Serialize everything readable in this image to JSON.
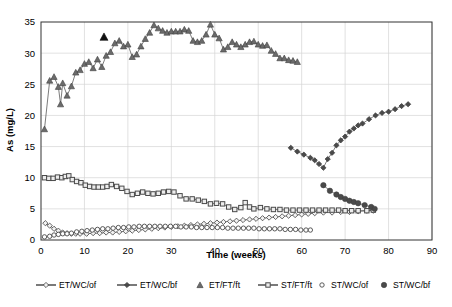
{
  "chart_data": {
    "type": "line",
    "title": "",
    "xlabel": "Time (weeks)",
    "ylabel": "As (mg/L)",
    "xlim": [
      0,
      90
    ],
    "ylim": [
      0,
      35
    ],
    "xticks": [
      0,
      10,
      20,
      30,
      40,
      50,
      60,
      70,
      80,
      90
    ],
    "yticks": [
      0,
      5,
      10,
      15,
      20,
      25,
      30,
      35
    ],
    "grid": true,
    "legend_position": "bottom",
    "series": [
      {
        "name": "ET/WC/of",
        "marker": "open-diamond",
        "color": "#555555",
        "line": true,
        "points": [
          [
            1.0,
            2.7
          ],
          [
            2.0,
            2.3
          ],
          [
            3.0,
            1.8
          ],
          [
            4.0,
            1.5
          ],
          [
            5.0,
            1.2
          ],
          [
            6.0,
            1.1
          ],
          [
            7.0,
            1.0
          ],
          [
            8.0,
            1.0
          ],
          [
            9.0,
            1.0
          ],
          [
            10.5,
            1.0
          ],
          [
            12.0,
            1.1
          ],
          [
            13.5,
            1.1
          ],
          [
            15.0,
            1.2
          ],
          [
            16.5,
            1.2
          ],
          [
            18.0,
            1.3
          ],
          [
            19.5,
            1.4
          ],
          [
            21.0,
            1.5
          ],
          [
            22.5,
            1.6
          ],
          [
            24.0,
            1.7
          ],
          [
            25.5,
            1.8
          ],
          [
            27.0,
            1.9
          ],
          [
            28.5,
            2.0
          ],
          [
            30.0,
            2.1
          ],
          [
            31.5,
            2.2
          ],
          [
            33.0,
            2.3
          ],
          [
            34.5,
            2.4
          ],
          [
            36.0,
            2.5
          ],
          [
            37.5,
            2.6
          ],
          [
            39.0,
            2.7
          ],
          [
            40.5,
            2.8
          ],
          [
            42.0,
            2.9
          ],
          [
            43.5,
            3.0
          ],
          [
            45.0,
            3.1
          ],
          [
            46.5,
            3.2
          ],
          [
            48.0,
            3.3
          ],
          [
            49.5,
            3.4
          ],
          [
            51.0,
            3.5
          ],
          [
            52.5,
            3.6
          ],
          [
            54.0,
            3.7
          ],
          [
            55.5,
            3.8
          ],
          [
            57.0,
            3.9
          ],
          [
            58.5,
            4.0
          ],
          [
            60.0,
            4.1
          ],
          [
            61.5,
            4.2
          ],
          [
            63.0,
            4.3
          ],
          [
            65.0,
            4.4
          ],
          [
            67.0,
            4.4
          ],
          [
            69.0,
            4.5
          ],
          [
            71.0,
            4.5
          ],
          [
            73.0,
            4.6
          ],
          [
            75.0,
            4.7
          ],
          [
            76.5,
            4.7
          ]
        ]
      },
      {
        "name": "ET/WC/bf",
        "marker": "filled-diamond",
        "color": "#4a4a4a",
        "line": true,
        "points": [
          [
            57.5,
            14.8
          ],
          [
            59.0,
            14.2
          ],
          [
            60.5,
            13.7
          ],
          [
            62.0,
            13.2
          ],
          [
            63.0,
            12.8
          ],
          [
            64.0,
            12.2
          ],
          [
            65.0,
            11.6
          ],
          [
            66.0,
            13.0
          ],
          [
            67.0,
            14.0
          ],
          [
            68.0,
            15.2
          ],
          [
            69.0,
            16.0
          ],
          [
            70.0,
            16.6
          ],
          [
            71.0,
            17.4
          ],
          [
            72.0,
            17.9
          ],
          [
            73.0,
            18.4
          ],
          [
            74.0,
            18.7
          ],
          [
            75.5,
            19.4
          ],
          [
            77.0,
            20.0
          ],
          [
            78.5,
            20.4
          ],
          [
            80.0,
            20.6
          ],
          [
            81.5,
            21.0
          ],
          [
            83.0,
            21.5
          ],
          [
            84.5,
            21.8
          ]
        ]
      },
      {
        "name": "ET/FT/ft",
        "marker": "filled-triangle",
        "color": "#6b6b6b",
        "line": true,
        "points": [
          [
            0.8,
            17.8
          ],
          [
            2.0,
            25.6
          ],
          [
            3.0,
            26.2
          ],
          [
            4.0,
            24.6
          ],
          [
            4.5,
            21.8
          ],
          [
            5.0,
            25.2
          ],
          [
            6.0,
            23.2
          ],
          [
            7.0,
            24.7
          ],
          [
            8.0,
            26.9
          ],
          [
            9.0,
            27.3
          ],
          [
            10.0,
            28.3
          ],
          [
            11.0,
            28.6
          ],
          [
            12.0,
            27.6
          ],
          [
            13.0,
            29.0
          ],
          [
            14.0,
            27.8
          ],
          [
            15.0,
            29.6
          ],
          [
            16.0,
            30.2
          ],
          [
            17.0,
            31.6
          ],
          [
            18.0,
            32.0
          ],
          [
            19.0,
            31.1
          ],
          [
            20.0,
            31.4
          ],
          [
            21.0,
            29.4
          ],
          [
            22.0,
            29.8
          ],
          [
            23.0,
            31.1
          ],
          [
            24.0,
            32.3
          ],
          [
            25.0,
            33.3
          ],
          [
            26.0,
            34.5
          ],
          [
            27.0,
            34.0
          ],
          [
            28.0,
            33.6
          ],
          [
            29.0,
            33.3
          ],
          [
            30.0,
            33.5
          ],
          [
            31.0,
            33.5
          ],
          [
            32.0,
            33.5
          ],
          [
            33.0,
            33.8
          ],
          [
            34.0,
            33.6
          ],
          [
            35.0,
            32.0
          ],
          [
            36.0,
            31.8
          ],
          [
            37.0,
            32.0
          ],
          [
            38.0,
            33.0
          ],
          [
            39.0,
            34.6
          ],
          [
            40.0,
            33.0
          ],
          [
            41.0,
            32.4
          ],
          [
            42.0,
            30.6
          ],
          [
            43.0,
            31.0
          ],
          [
            44.0,
            31.8
          ],
          [
            45.0,
            31.4
          ],
          [
            46.0,
            31.0
          ],
          [
            47.0,
            31.4
          ],
          [
            48.0,
            31.8
          ],
          [
            49.0,
            31.9
          ],
          [
            50.0,
            31.4
          ],
          [
            51.0,
            31.2
          ],
          [
            52.0,
            31.3
          ],
          [
            53.0,
            30.4
          ],
          [
            54.0,
            29.9
          ],
          [
            55.0,
            29.2
          ],
          [
            56.0,
            29.2
          ],
          [
            57.0,
            28.9
          ],
          [
            58.0,
            28.8
          ],
          [
            59.0,
            28.6
          ]
        ]
      },
      {
        "name": "ST/FT/ft",
        "marker": "open-square",
        "color": "#777777",
        "line": true,
        "points": [
          [
            0.8,
            10.0
          ],
          [
            1.8,
            9.9
          ],
          [
            2.8,
            9.9
          ],
          [
            3.8,
            10.1
          ],
          [
            4.8,
            10.0
          ],
          [
            5.6,
            10.2
          ],
          [
            6.4,
            10.3
          ],
          [
            7.2,
            9.7
          ],
          [
            8.2,
            9.4
          ],
          [
            9.2,
            9.2
          ],
          [
            10.2,
            8.8
          ],
          [
            11.2,
            8.6
          ],
          [
            12.2,
            8.5
          ],
          [
            13.2,
            8.5
          ],
          [
            14.2,
            8.5
          ],
          [
            15.2,
            8.6
          ],
          [
            16.2,
            8.9
          ],
          [
            17.4,
            8.6
          ],
          [
            18.6,
            8.3
          ],
          [
            19.8,
            7.8
          ],
          [
            21.0,
            7.3
          ],
          [
            22.2,
            7.5
          ],
          [
            23.4,
            7.7
          ],
          [
            24.6,
            7.5
          ],
          [
            25.8,
            7.4
          ],
          [
            27.0,
            7.5
          ],
          [
            28.2,
            7.7
          ],
          [
            29.4,
            7.8
          ],
          [
            30.6,
            7.7
          ],
          [
            32.0,
            7.1
          ],
          [
            33.4,
            6.6
          ],
          [
            34.8,
            6.6
          ],
          [
            36.2,
            6.4
          ],
          [
            37.6,
            6.2
          ],
          [
            39.0,
            5.8
          ],
          [
            40.4,
            5.9
          ],
          [
            41.8,
            5.8
          ],
          [
            43.2,
            5.3
          ],
          [
            44.6,
            4.9
          ],
          [
            46.0,
            5.2
          ],
          [
            47.0,
            6.0
          ],
          [
            48.0,
            5.3
          ],
          [
            49.0,
            5.0
          ],
          [
            50.5,
            5.2
          ],
          [
            52.0,
            5.0
          ],
          [
            53.5,
            4.9
          ],
          [
            55.0,
            4.9
          ],
          [
            56.5,
            4.8
          ],
          [
            58.0,
            4.8
          ],
          [
            59.5,
            4.8
          ],
          [
            61.0,
            4.8
          ],
          [
            62.5,
            4.8
          ],
          [
            64.0,
            4.8
          ],
          [
            65.5,
            4.8
          ],
          [
            67.0,
            4.8
          ],
          [
            68.5,
            4.8
          ],
          [
            70.0,
            4.7
          ],
          [
            71.5,
            4.7
          ],
          [
            73.0,
            4.7
          ],
          [
            75.0,
            4.7
          ],
          [
            76.5,
            4.8
          ]
        ]
      },
      {
        "name": "ST/WC/of",
        "marker": "open-circle",
        "color": "#555555",
        "line": true,
        "points": [
          [
            0.8,
            0.5
          ],
          [
            2.0,
            0.6
          ],
          [
            3.0,
            0.8
          ],
          [
            4.0,
            0.9
          ],
          [
            5.0,
            1.0
          ],
          [
            6.0,
            1.0
          ],
          [
            7.0,
            1.1
          ],
          [
            8.2,
            1.3
          ],
          [
            9.4,
            1.4
          ],
          [
            10.6,
            1.5
          ],
          [
            11.8,
            1.6
          ],
          [
            13.0,
            1.7
          ],
          [
            14.2,
            1.8
          ],
          [
            15.4,
            1.8
          ],
          [
            16.6,
            1.9
          ],
          [
            17.8,
            2.0
          ],
          [
            19.0,
            2.0
          ],
          [
            20.2,
            2.1
          ],
          [
            21.4,
            2.1
          ],
          [
            22.6,
            2.2
          ],
          [
            23.8,
            2.2
          ],
          [
            25.0,
            2.2
          ],
          [
            26.2,
            2.2
          ],
          [
            27.4,
            2.2
          ],
          [
            28.6,
            2.2
          ],
          [
            29.8,
            2.2
          ],
          [
            31.0,
            2.2
          ],
          [
            32.2,
            2.1
          ],
          [
            33.4,
            2.1
          ],
          [
            34.6,
            2.1
          ],
          [
            35.8,
            2.0
          ],
          [
            37.0,
            2.0
          ],
          [
            38.2,
            2.0
          ],
          [
            39.4,
            2.0
          ],
          [
            40.6,
            2.0
          ],
          [
            41.8,
            2.0
          ],
          [
            43.0,
            1.9
          ],
          [
            44.2,
            1.9
          ],
          [
            45.4,
            1.9
          ],
          [
            46.6,
            1.9
          ],
          [
            47.8,
            1.9
          ],
          [
            49.0,
            1.9
          ],
          [
            50.2,
            1.8
          ],
          [
            51.4,
            1.8
          ],
          [
            52.6,
            1.8
          ],
          [
            53.8,
            1.8
          ],
          [
            55.0,
            1.8
          ],
          [
            56.2,
            1.7
          ],
          [
            57.4,
            1.7
          ],
          [
            58.6,
            1.7
          ],
          [
            59.8,
            1.6
          ],
          [
            61.0,
            1.6
          ],
          [
            62.0,
            1.6
          ]
        ]
      },
      {
        "name": "ST/WC/bf",
        "marker": "filled-circle",
        "color": "#4a4a4a",
        "line": true,
        "points": [
          [
            65.0,
            8.8
          ],
          [
            66.5,
            7.9
          ],
          [
            68.0,
            7.3
          ],
          [
            69.0,
            6.9
          ],
          [
            70.0,
            6.6
          ],
          [
            71.0,
            6.3
          ],
          [
            72.0,
            6.1
          ],
          [
            73.0,
            5.9
          ],
          [
            74.5,
            5.6
          ],
          [
            76.0,
            5.3
          ],
          [
            76.8,
            5.0
          ]
        ]
      }
    ],
    "annotations": [
      {
        "label": "ET/FT/ft highlighted marker",
        "marker": "filled-triangle-black",
        "x": 14.5,
        "y": 32.6
      }
    ]
  },
  "legend": {
    "items": [
      {
        "label": "ET/WC/of",
        "marker": "open-diamond",
        "with_line": true
      },
      {
        "label": "ET/WC/bf",
        "marker": "filled-diamond",
        "with_line": true
      },
      {
        "label": "ET/FT/ft",
        "marker": "filled-triangle",
        "with_line": false
      },
      {
        "label": "ST/FT/ft",
        "marker": "open-square",
        "with_line": true
      },
      {
        "label": "ST/WC/of",
        "marker": "open-circle",
        "with_line": false
      },
      {
        "label": "ST/WC/bf",
        "marker": "filled-circle",
        "with_line": false
      }
    ]
  },
  "colors": {
    "frame": "#333333",
    "grid": "#d4d4d4",
    "marker_fill": "#6b6b6b",
    "marker_stroke": "#444444",
    "background": "#ffffff"
  }
}
